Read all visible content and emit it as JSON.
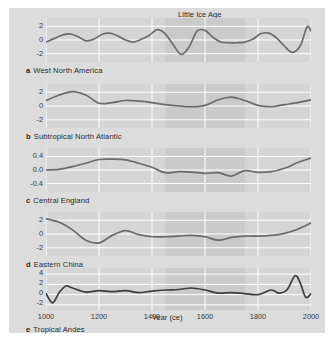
{
  "figure": {
    "era_band_label": "Little Ice Age",
    "xlabel": "Year (ce)",
    "background_color": "#dcdcdc",
    "panel_color": "#d5d5d5",
    "grid_color": "#ffffff",
    "curve_color": "#6b6b6b",
    "curve_color_dark": "#3c3c3c",
    "band_color": "#cacaca"
  },
  "chart_data": {
    "type": "line",
    "title": "",
    "xlabel": "Year (ce)",
    "ylabel": "",
    "xlim": [
      1000,
      2000
    ],
    "xticks": [
      1000,
      1200,
      1400,
      1600,
      1800,
      2000
    ],
    "xticklabels": [
      "1000",
      "1200",
      "1400",
      "1600",
      "1800",
      "2000"
    ],
    "grid": true,
    "legend": "none",
    "annotations": [
      {
        "text": "Little Ice Age",
        "type": "shaded-band",
        "x_start": 1450,
        "x_end": 1750
      }
    ],
    "panels": [
      {
        "tag": "a",
        "name": "West North America",
        "ylim": [
          -3.2,
          3.2
        ],
        "yticks": [
          2,
          0,
          -2
        ],
        "yticklabels": [
          "2",
          "0",
          "-2"
        ],
        "x": [
          1000,
          1030,
          1060,
          1090,
          1120,
          1150,
          1180,
          1210,
          1240,
          1270,
          1300,
          1330,
          1360,
          1390,
          1420,
          1450,
          1480,
          1510,
          1540,
          1570,
          1600,
          1630,
          1660,
          1690,
          1720,
          1750,
          1780,
          1810,
          1840,
          1870,
          1900,
          1930,
          1960,
          1985,
          2000
        ],
        "values": [
          -0.3,
          0.2,
          0.7,
          0.9,
          0.5,
          -0.1,
          0.1,
          0.8,
          1.0,
          0.6,
          0.0,
          -0.3,
          0.1,
          0.7,
          1.5,
          0.9,
          -0.7,
          -2.1,
          -1.0,
          1.3,
          1.4,
          0.4,
          -0.3,
          -0.4,
          -0.4,
          -0.3,
          0.1,
          0.9,
          1.0,
          0.3,
          -0.9,
          -1.8,
          -0.8,
          1.9,
          1.3
        ]
      },
      {
        "tag": "b",
        "name": "Subtropical North Atlantic",
        "ylim": [
          -3.2,
          3.2
        ],
        "yticks": [
          2,
          0,
          -2
        ],
        "yticklabels": [
          "2",
          "0",
          "-2"
        ],
        "x": [
          1000,
          1050,
          1100,
          1150,
          1200,
          1250,
          1300,
          1350,
          1400,
          1450,
          1500,
          1550,
          1600,
          1650,
          1700,
          1750,
          1800,
          1850,
          1900,
          1950,
          2000
        ],
        "values": [
          0.8,
          1.6,
          2.1,
          1.6,
          0.4,
          0.5,
          0.8,
          0.7,
          0.5,
          0.2,
          0.0,
          -0.1,
          0.1,
          0.9,
          1.3,
          0.8,
          0.1,
          -0.1,
          0.2,
          0.5,
          0.9
        ]
      },
      {
        "tag": "c",
        "name": "Central England",
        "ylim": [
          -0.65,
          0.65
        ],
        "yticks": [
          0.4,
          0.0,
          -0.4
        ],
        "yticklabels": [
          "0.4",
          "0.0",
          "-0.4"
        ],
        "x": [
          1000,
          1050,
          1100,
          1150,
          1200,
          1250,
          1300,
          1350,
          1400,
          1450,
          1500,
          1550,
          1600,
          1650,
          1700,
          1750,
          1800,
          1850,
          1900,
          1950,
          2000
        ],
        "values": [
          0.0,
          0.02,
          0.1,
          0.2,
          0.31,
          0.32,
          0.3,
          0.2,
          0.08,
          -0.08,
          -0.05,
          -0.06,
          -0.1,
          -0.08,
          -0.18,
          -0.02,
          -0.07,
          -0.05,
          0.05,
          0.22,
          0.35
        ]
      },
      {
        "tag": "d",
        "name": "Eastern China",
        "ylim": [
          -3.2,
          3.2
        ],
        "yticks": [
          2,
          0,
          -2
        ],
        "yticklabels": [
          "2",
          "0",
          "-2"
        ],
        "x": [
          1000,
          1050,
          1100,
          1150,
          1200,
          1250,
          1300,
          1350,
          1400,
          1450,
          1500,
          1550,
          1600,
          1650,
          1700,
          1750,
          1800,
          1850,
          1900,
          1950,
          2000
        ],
        "values": [
          2.2,
          1.7,
          0.6,
          -0.9,
          -1.3,
          -0.2,
          0.5,
          -0.1,
          -0.4,
          -0.4,
          -0.3,
          -0.2,
          -0.4,
          -0.9,
          -0.5,
          -0.3,
          -0.3,
          -0.2,
          0.1,
          0.7,
          1.6
        ]
      },
      {
        "tag": "e",
        "name": "Tropical Andes",
        "ylim": [
          -3.0,
          5.2
        ],
        "yticks": [
          4,
          2,
          0,
          -2
        ],
        "yticklabels": [
          "4",
          "2",
          "0",
          "-2"
        ],
        "x": [
          1000,
          1025,
          1050,
          1075,
          1100,
          1150,
          1200,
          1250,
          1300,
          1350,
          1400,
          1450,
          1500,
          1550,
          1600,
          1650,
          1700,
          1750,
          1800,
          1850,
          1880,
          1910,
          1940,
          1960,
          1980,
          2000
        ],
        "values": [
          0.2,
          -1.6,
          0.4,
          1.7,
          1.3,
          0.5,
          0.8,
          0.6,
          0.8,
          0.4,
          0.7,
          0.9,
          1.0,
          1.3,
          0.9,
          0.3,
          0.4,
          0.2,
          0.0,
          0.9,
          0.3,
          1.0,
          3.7,
          2.2,
          -0.5,
          0.2
        ]
      }
    ]
  }
}
